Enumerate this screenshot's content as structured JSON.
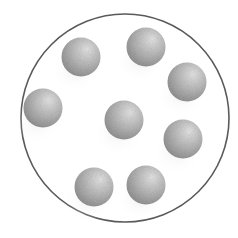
{
  "diagram": {
    "container": {
      "shape": "circle",
      "cx": 125,
      "cy": 118,
      "r": 104,
      "stroke": "#5a5a5a",
      "stroke_width": 1.6,
      "fill": "#ffffff"
    },
    "particle_style": {
      "radius": 19.5,
      "light_color": "#e4e4e4",
      "mid_color": "#b4b4b4",
      "dark_color": "#8a8a8a",
      "light_direction": "upper-right"
    },
    "particles": [
      {
        "id": "p1",
        "label": "particle-top-left",
        "cx": 81,
        "cy": 57
      },
      {
        "id": "p2",
        "label": "particle-top-center",
        "cx": 146,
        "cy": 47
      },
      {
        "id": "p3",
        "label": "particle-upper-right",
        "cx": 187,
        "cy": 82
      },
      {
        "id": "p4",
        "label": "particle-left",
        "cx": 43,
        "cy": 108
      },
      {
        "id": "p5",
        "label": "particle-center",
        "cx": 124,
        "cy": 120
      },
      {
        "id": "p6",
        "label": "particle-lower-right",
        "cx": 183,
        "cy": 139
      },
      {
        "id": "p7",
        "label": "particle-bottom-left",
        "cx": 94,
        "cy": 187
      },
      {
        "id": "p8",
        "label": "particle-bottom-right",
        "cx": 146,
        "cy": 185
      }
    ],
    "particle_count": 8
  }
}
